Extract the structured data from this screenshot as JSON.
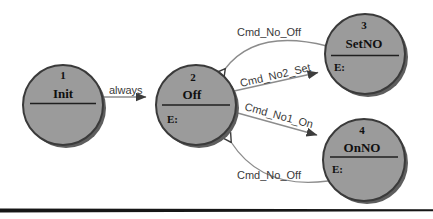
{
  "figure": {
    "kind": "state-transition-diagram"
  },
  "states": {
    "init": {
      "number": "1",
      "name": "Init",
      "entry": ""
    },
    "off": {
      "number": "2",
      "name": "Off",
      "entry": "E:"
    },
    "setno": {
      "number": "3",
      "name": "SetNO",
      "entry": "E:"
    },
    "onno": {
      "number": "4",
      "name": "OnNO",
      "entry": "E:"
    }
  },
  "transitions": {
    "init_to_off": {
      "label": "always",
      "from": "Init",
      "to": "Off"
    },
    "setno_to_off": {
      "label": "Cmd_No_Off",
      "from": "SetNO",
      "to": "Off"
    },
    "off_to_setno": {
      "label": "Cmd_No2_Set",
      "from": "Off",
      "to": "SetNO"
    },
    "off_to_onno": {
      "label": "Cmd_No1_On",
      "from": "Off",
      "to": "OnNO"
    },
    "onno_to_off": {
      "label": "Cmd_No_Off",
      "from": "OnNO",
      "to": "Off"
    }
  },
  "colors": {
    "state_fill": "#9b9b9b",
    "state_border": "#3a3a3a",
    "state_shadow": "#5e5e5e",
    "edge_line": "#8c8c8c",
    "arrowhead": "#3c3c3c",
    "text": "#101010",
    "label_text": "#3a3a3a",
    "rule_line": "#161616",
    "background": "#ffffff"
  }
}
